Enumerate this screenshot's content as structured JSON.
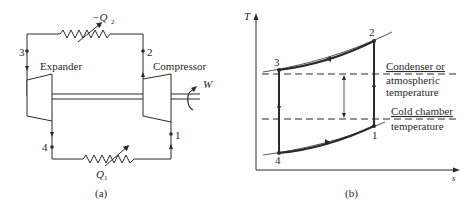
{
  "panel_a": {
    "caption": "(a)",
    "expander_label": "Expander",
    "compressor_label": "Compressor",
    "work_label": "W",
    "heat_rejected_label": "−Q",
    "heat_rejected_sub": "2",
    "heat_absorbed_label": "Q",
    "heat_absorbed_sub": "1",
    "state_points": [
      "1",
      "2",
      "3",
      "4"
    ]
  },
  "panel_b": {
    "caption": "(b)",
    "y_axis_label": "T",
    "x_axis_label": "s",
    "condenser_label_line1": "Condenser or",
    "condenser_label_line2": "atmospheric",
    "condenser_label_line3": "temperature",
    "cold_label_line1": "Cold chamber",
    "cold_label_line2": "temperature",
    "state_points": [
      "1",
      "2",
      "3",
      "4"
    ]
  },
  "colors": {
    "line": "#2a2a2a",
    "background": "#ffffff"
  }
}
